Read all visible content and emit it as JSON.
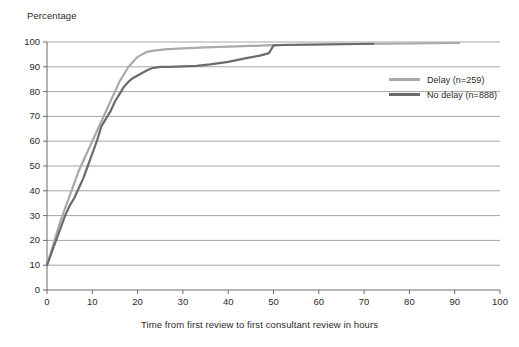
{
  "chart_data": {
    "type": "line",
    "title": "",
    "ylabel": "Percentage",
    "xlabel": "Time from first review to first consultant review in hours",
    "xlim": [
      0,
      100
    ],
    "ylim": [
      0,
      100
    ],
    "xticks": [
      "0",
      "10",
      "20",
      "30",
      "40",
      "50",
      "60",
      "70",
      "80",
      "90",
      "100"
    ],
    "yticks": [
      "0",
      "10",
      "20",
      "30",
      "40",
      "50",
      "60",
      "70",
      "80",
      "90",
      "100"
    ],
    "grid": "horizontal",
    "legend_position": "upper-right-inside",
    "series": [
      {
        "name": "Delay (n=259)",
        "color": "#a9a9a9",
        "x": [
          0,
          1,
          2,
          3,
          4,
          5,
          6,
          7,
          8,
          9,
          10,
          11,
          12,
          13,
          14,
          15,
          16,
          17,
          18,
          19,
          20,
          21,
          22,
          24,
          26,
          28,
          30,
          35,
          40,
          45,
          50,
          55,
          60,
          65,
          70,
          75,
          80,
          85,
          91
        ],
        "y": [
          10,
          16,
          22,
          28,
          33,
          38,
          43,
          48,
          52,
          56,
          60,
          64,
          68,
          72,
          76,
          80,
          84,
          87,
          90,
          92,
          94,
          95,
          96,
          96.6,
          97,
          97.2,
          97.4,
          97.8,
          98.1,
          98.4,
          98.7,
          98.9,
          99,
          99.1,
          99.2,
          99.3,
          99.4,
          99.5,
          99.6
        ]
      },
      {
        "name": "No delay (n=888)",
        "color": "#6b6b6b",
        "x": [
          0,
          1,
          2,
          3,
          4,
          5,
          6,
          7,
          8,
          9,
          10,
          11,
          12,
          13,
          14,
          15,
          16,
          17,
          18,
          19,
          20,
          21,
          22,
          23,
          24,
          25,
          27,
          30,
          33,
          36,
          40,
          44,
          47,
          49,
          50,
          52,
          56,
          60,
          64,
          68,
          72
        ],
        "y": [
          10,
          15,
          20,
          25,
          30,
          34,
          37,
          41,
          45,
          50,
          55,
          60,
          66,
          69,
          72,
          76,
          79,
          82,
          84,
          85.5,
          86.5,
          87.5,
          88.5,
          89.3,
          89.7,
          90,
          90,
          90.2,
          90.4,
          91,
          92,
          93.5,
          94.5,
          95.5,
          98.6,
          98.8,
          98.9,
          99,
          99.1,
          99.2,
          99.3
        ]
      }
    ]
  },
  "axes": {
    "ylabel_text": "Percentage",
    "xlabel_text": "Time from first review to first consultant review in hours"
  },
  "legend": {
    "items": [
      {
        "label": "Delay (n=259)",
        "color": "#a9a9a9"
      },
      {
        "label": "No delay (n=888)",
        "color": "#6b6b6b"
      }
    ]
  },
  "colors": {
    "grid": "#9a9a9a",
    "axis": "#6a6a6a",
    "text": "#2a2a2a",
    "delay_series": "#a9a9a9",
    "no_delay_series": "#6b6b6b"
  }
}
